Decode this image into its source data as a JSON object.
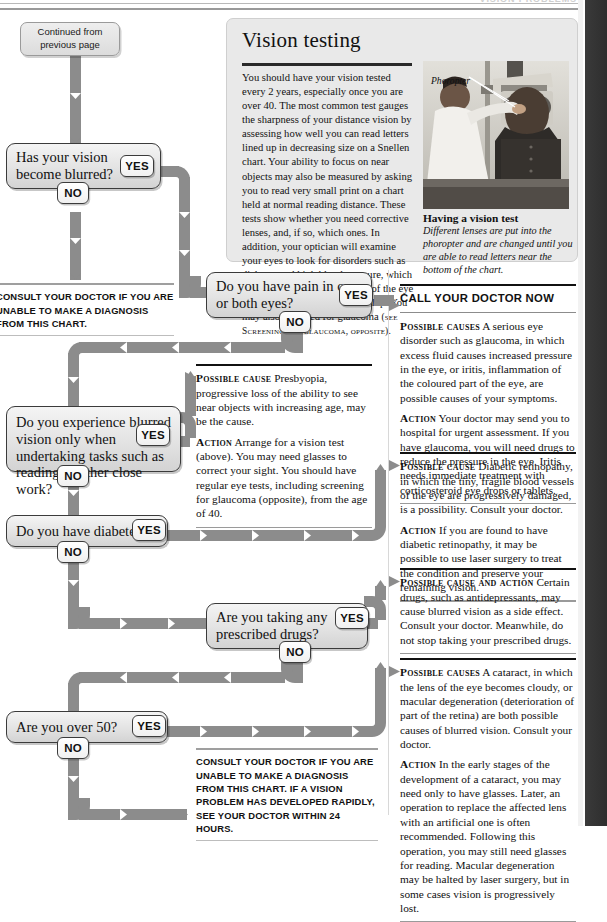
{
  "header": {
    "title": "VISION PROBLEMS"
  },
  "start_box": {
    "line1": "Continued from",
    "line2": "previous page"
  },
  "labels": {
    "yes": "YES",
    "no": "NO"
  },
  "questions": [
    {
      "id": "q-blurred",
      "text": "Has your vision become blurred?"
    },
    {
      "id": "q-pain",
      "text": "Do you have pain in one or both eyes?"
    },
    {
      "id": "q-close-work",
      "text": "Do you experience blurred vision only when undertaking tasks such as reading or other close work?"
    },
    {
      "id": "q-diabetes",
      "text": "Do you have diabetes?"
    },
    {
      "id": "q-drugs",
      "text": "Are you taking any prescribed drugs?"
    },
    {
      "id": "q-over-50",
      "text": "Are you over 50?"
    }
  ],
  "feature": {
    "title": "Vision testing",
    "body": "You should have your vision tested every 2 years, especially once you are over 40. The most common test gauges the sharpness of your distance vision by assessing how well you can read letters lined up in decreasing size on a Snellen chart. Your ability to focus on near objects may also be measured by asking you to read very small print on a chart held at normal reading distance. These tests show whether you need corrective lenses, and, if so, which ones. In addition, your optician will examine your eyes to look for disorders such as diabetes and high blood pressure, which can cause changes in the back of the eye before general symptoms develop. You may also be tested for glaucoma",
    "body_ref": "(see Screening for glaucoma, opposite).",
    "photo_label": "Phoropter",
    "caption_title": "Having a vision test",
    "caption_body": "Different lenses are put into the phoropter and are changed until you are able to read letters near the bottom of the chart."
  },
  "advice": {
    "consult_left": "Consult your doctor if you are unable to make a diagnosis from this chart.",
    "call_doctor": {
      "heading": "CALL YOUR DOCTOR NOW",
      "cause_lead": "Possible causes",
      "cause_text": "A serious eye disorder such as glaucoma, in which excess fluid causes increased pressure in the eye, or iritis, inflammation of the coloured part of the eye, are possible causes of your symptoms.",
      "action_lead": "Action",
      "action_text": "Your doctor may send you to hospital for urgent assessment. If you have glaucoma, you will need drugs to reduce the pressure in the eye. Iritis needs immediate treatment with corticosteroid eye drops or tablets."
    },
    "presbyopia": {
      "cause_lead": "Possible cause",
      "cause_text": "Presbyopia, progressive loss of the ability to see near objects with increasing age, may be the cause.",
      "action_lead": "Action",
      "action_text": "Arrange for a vision test (above). You may need glasses to correct your sight. You should have regular eye tests, including screening for glaucoma (opposite), from the age of 40."
    },
    "retinopathy": {
      "cause_lead": "Possible cause",
      "cause_text": "Diabetic retinopathy, in which the tiny, fragile blood vessels of the eye are progressively damaged, is a possibility. Consult your doctor.",
      "action_lead": "Action",
      "action_text": "If you are found to have diabetic retinopathy, it may be possible to use laser surgery to treat the condition and preserve your remaining vision."
    },
    "drugs": {
      "cause_lead": "Possible cause and action",
      "cause_text": "Certain drugs, such as antidepressants, may cause blurred vision as a side effect. Consult your doctor. Meanwhile, do not stop taking your prescribed drugs."
    },
    "cataract": {
      "cause_lead": "Possible causes",
      "cause_text": "A cataract, in which the lens of the eye becomes cloudy, or macular degeneration (deterioration of part of the retina) are both possible causes of blurred vision. Consult your doctor.",
      "action_lead": "Action",
      "action_text": "In the early stages of the development of a cataract, you may need only to have glasses. Later, an operation to replace the affected lens with an artificial one is often recommended. Following this operation, you may still need glasses for reading. Macular degeneration may be halted by laser surgery, but in some cases vision is progressively lost."
    },
    "consult_bottom": "Consult your doctor if you are unable to make a diagnosis from this chart. If a vision problem has developed rapidly, see your doctor within 24 hours."
  },
  "colors": {
    "connector": "#8c8c8c",
    "box_border": "#3b3b3b",
    "panel_bg": "#e9e9e9",
    "rule_dark": "#111111"
  }
}
